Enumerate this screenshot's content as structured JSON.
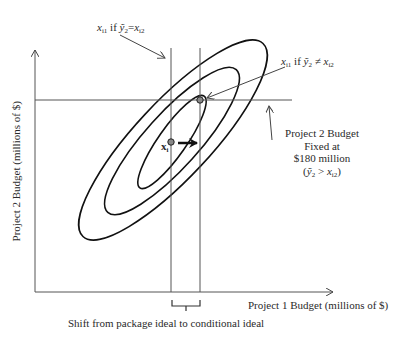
{
  "figure": {
    "x_axis_label": "Project 1 Budget (millions of $)",
    "y_axis_label": "Project 2 Budget (millions of $)",
    "bracket_caption": "Shift from package ideal to conditional ideal",
    "ideal_point_label": "x",
    "ideal_point_subscript": "i",
    "annotation_top_left": {
      "var": "x",
      "var_sub": "i1",
      "mid": " if ",
      "ybar": "ỹ",
      "ybar_sub": "2",
      "op": "=",
      "rhs": "x",
      "rhs_sub": "i2"
    },
    "annotation_top_right": {
      "var": "x",
      "var_sub": "i1",
      "mid": " if ",
      "ybar": "ỹ",
      "ybar_sub": "2",
      "op": " ≠ ",
      "rhs": "x",
      "rhs_sub": "i2"
    },
    "fixed_budget_note": {
      "line1": "Project 2 Budget",
      "line2": "Fixed at",
      "line3": "$180 million",
      "line4_open": "(",
      "line4_ybar": "ỹ",
      "line4_sub": "2",
      "line4_op": " > ",
      "line4_rhs": "x",
      "line4_rhs_sub": "i2",
      "line4_close": ")"
    },
    "colors": {
      "ellipse": "#111111",
      "axis": "#555555",
      "guide_line": "#555555",
      "text": "#2a2a2a"
    }
  }
}
